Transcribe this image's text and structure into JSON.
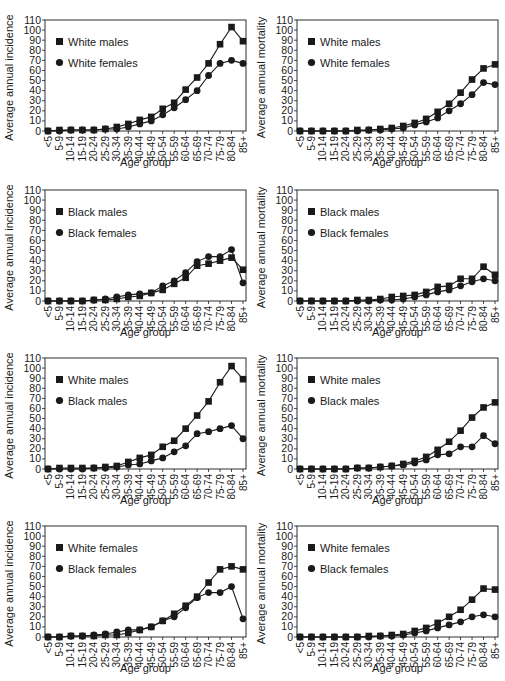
{
  "chart_data": [
    {
      "type": "line",
      "panel": "top-left",
      "xlabel": "Age group",
      "ylabel": "Average annual incidence",
      "ylim": [
        0,
        110
      ],
      "categories": [
        "<5",
        "5-9",
        "10-14",
        "15-19",
        "20-24",
        "25-29",
        "30-34",
        "35-39",
        "40-44",
        "45-49",
        "50-54",
        "55-59",
        "60-64",
        "65-69",
        "70-74",
        "75-79",
        "80-84",
        "85+"
      ],
      "series": [
        {
          "name": "White males",
          "marker": "square",
          "values": [
            0,
            1,
            1,
            1,
            1,
            2,
            4,
            7,
            11,
            14,
            22,
            28,
            41,
            53,
            67,
            86,
            103,
            89
          ]
        },
        {
          "name": "White females",
          "marker": "circle",
          "values": [
            0,
            0,
            1,
            1,
            1,
            2,
            2,
            4,
            7,
            10,
            16,
            23,
            31,
            40,
            55,
            67,
            70,
            67
          ]
        }
      ],
      "legend_position": "upper-left",
      "grid": false
    },
    {
      "type": "line",
      "panel": "top-right",
      "xlabel": "Age group",
      "ylabel": "Average annual mortality",
      "ylim": [
        0,
        110
      ],
      "categories": [
        "<5",
        "5-9",
        "10-14",
        "15-19",
        "20-24",
        "25-29",
        "30-34",
        "35-39",
        "40-44",
        "45-49",
        "50-54",
        "55-59",
        "60-64",
        "65-69",
        "70-74",
        "75-79",
        "80-84",
        "85+"
      ],
      "series": [
        {
          "name": "White males",
          "marker": "square",
          "values": [
            0,
            0,
            0,
            0,
            0,
            1,
            1,
            2,
            3,
            5,
            8,
            12,
            19,
            27,
            38,
            51,
            62,
            66
          ]
        },
        {
          "name": "White females",
          "marker": "circle",
          "values": [
            0,
            0,
            0,
            0,
            0,
            0,
            1,
            1,
            2,
            3,
            6,
            9,
            13,
            20,
            27,
            36,
            48,
            46
          ]
        }
      ],
      "legend_position": "upper-left",
      "grid": false
    },
    {
      "type": "line",
      "panel": "row2-left",
      "xlabel": "Age group",
      "ylabel": "Average annual incidence",
      "ylim": [
        0,
        110
      ],
      "categories": [
        "<5",
        "5-9",
        "10-14",
        "15-19",
        "20-24",
        "25-29",
        "30-34",
        "35-39",
        "40-44",
        "45-49",
        "50-54",
        "55-59",
        "60-64",
        "65-69",
        "70-74",
        "75-79",
        "80-84",
        "85+"
      ],
      "series": [
        {
          "name": "Black males",
          "marker": "square",
          "values": [
            0,
            0,
            0,
            0,
            1,
            1,
            2,
            4,
            5,
            8,
            11,
            17,
            23,
            35,
            37,
            40,
            43,
            31
          ]
        },
        {
          "name": "Black females",
          "marker": "circle",
          "values": [
            0,
            0,
            0,
            0,
            1,
            2,
            4,
            6,
            7,
            8,
            15,
            20,
            28,
            39,
            44,
            44,
            51,
            18
          ]
        }
      ],
      "legend_position": "upper-left",
      "grid": false
    },
    {
      "type": "line",
      "panel": "row2-right",
      "xlabel": "Age group",
      "ylabel": "Average annual mortality",
      "ylim": [
        0,
        110
      ],
      "categories": [
        "<5",
        "5-9",
        "10-14",
        "15-19",
        "20-24",
        "25-29",
        "30-34",
        "35-39",
        "40-44",
        "45-49",
        "50-54",
        "55-59",
        "60-64",
        "65-69",
        "70-74",
        "75-79",
        "80-84",
        "85+"
      ],
      "series": [
        {
          "name": "Black males",
          "marker": "square",
          "values": [
            0,
            0,
            0,
            0,
            0,
            1,
            1,
            2,
            4,
            5,
            6,
            9,
            14,
            15,
            22,
            22,
            34,
            26
          ]
        },
        {
          "name": "Black females",
          "marker": "circle",
          "values": [
            0,
            0,
            0,
            0,
            0,
            0,
            0,
            1,
            1,
            2,
            4,
            6,
            9,
            11,
            15,
            19,
            22,
            20
          ]
        }
      ],
      "legend_position": "upper-left",
      "grid": false
    },
    {
      "type": "line",
      "panel": "row3-left",
      "xlabel": "Age group",
      "ylabel": "Average annual incidence",
      "ylim": [
        0,
        110
      ],
      "categories": [
        "<5",
        "5-9",
        "10-14",
        "15-19",
        "20-24",
        "25-29",
        "30-34",
        "35-39",
        "40-44",
        "45-49",
        "50-54",
        "55-59",
        "60-64",
        "65-69",
        "70-74",
        "75-79",
        "80-84",
        "85+"
      ],
      "series": [
        {
          "name": "White males",
          "marker": "square",
          "values": [
            0,
            1,
            1,
            1,
            1,
            2,
            3,
            7,
            11,
            14,
            22,
            28,
            40,
            53,
            67,
            86,
            102,
            89
          ]
        },
        {
          "name": "Black males",
          "marker": "circle",
          "values": [
            0,
            0,
            0,
            0,
            1,
            1,
            2,
            4,
            5,
            8,
            11,
            17,
            23,
            35,
            37,
            40,
            43,
            30
          ]
        }
      ],
      "legend_position": "upper-left",
      "grid": false
    },
    {
      "type": "line",
      "panel": "row3-right",
      "xlabel": "Age group",
      "ylabel": "Average annual mortality",
      "ylim": [
        0,
        110
      ],
      "categories": [
        "<5",
        "5-9",
        "10-14",
        "15-19",
        "20-24",
        "25-29",
        "30-34",
        "35-39",
        "40-44",
        "45-49",
        "50-54",
        "55-59",
        "60-64",
        "65-69",
        "70-74",
        "75-79",
        "80-84",
        "85+"
      ],
      "series": [
        {
          "name": "White males",
          "marker": "square",
          "values": [
            0,
            0,
            0,
            0,
            0,
            1,
            1,
            2,
            3,
            5,
            8,
            12,
            19,
            27,
            38,
            51,
            61,
            66
          ]
        },
        {
          "name": "Black males",
          "marker": "circle",
          "values": [
            0,
            0,
            0,
            0,
            0,
            1,
            1,
            2,
            3,
            4,
            6,
            9,
            14,
            15,
            22,
            22,
            33,
            25
          ]
        }
      ],
      "legend_position": "upper-left",
      "grid": false
    },
    {
      "type": "line",
      "panel": "bottom-left",
      "xlabel": "Age group",
      "ylabel": "Average annual incidence",
      "ylim": [
        0,
        110
      ],
      "categories": [
        "<5",
        "5-9",
        "10-14",
        "15-19",
        "20-24",
        "25-29",
        "30-34",
        "35-39",
        "40-44",
        "45-49",
        "50-54",
        "55-59",
        "60-64",
        "65-69",
        "70-74",
        "75-79",
        "80-84",
        "85+"
      ],
      "series": [
        {
          "name": "White females",
          "marker": "square",
          "values": [
            0,
            0,
            1,
            1,
            1,
            2,
            2,
            4,
            7,
            10,
            16,
            23,
            31,
            40,
            54,
            67,
            70,
            67
          ]
        },
        {
          "name": "Black females",
          "marker": "circle",
          "values": [
            0,
            0,
            1,
            1,
            2,
            3,
            5,
            7,
            7,
            10,
            16,
            20,
            29,
            39,
            44,
            44,
            50,
            18
          ]
        }
      ],
      "legend_position": "upper-left",
      "grid": false
    },
    {
      "type": "line",
      "panel": "bottom-right",
      "xlabel": "Age group",
      "ylabel": "Average annual mortality",
      "ylim": [
        0,
        110
      ],
      "categories": [
        "<5",
        "5-9",
        "10-14",
        "15-19",
        "20-24",
        "25-29",
        "30-34",
        "35-39",
        "40-44",
        "45-49",
        "50-54",
        "55-59",
        "60-64",
        "65-69",
        "70-74",
        "75-79",
        "80-84",
        "85+"
      ],
      "series": [
        {
          "name": "White females",
          "marker": "square",
          "values": [
            0,
            0,
            0,
            0,
            0,
            0,
            1,
            1,
            2,
            3,
            6,
            9,
            14,
            20,
            27,
            37,
            48,
            47
          ]
        },
        {
          "name": "Black females",
          "marker": "circle",
          "values": [
            0,
            0,
            0,
            0,
            0,
            0,
            0,
            1,
            1,
            2,
            4,
            6,
            9,
            12,
            15,
            20,
            22,
            20
          ]
        }
      ],
      "legend_position": "upper-left",
      "grid": false
    }
  ],
  "yticks": [
    0,
    10,
    20,
    30,
    40,
    50,
    60,
    70,
    80,
    90,
    100,
    110
  ],
  "colors": {
    "line": "#1a1a1a",
    "background": "#ffffff"
  }
}
